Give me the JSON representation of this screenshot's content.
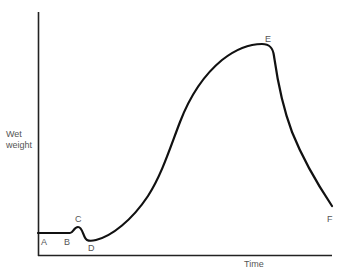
{
  "figure": {
    "y_axis_label_line1": "Wet",
    "y_axis_label_line2": "weight",
    "x_axis_label": "Time",
    "point_labels": {
      "A": "A",
      "B": "B",
      "C": "C",
      "D": "D",
      "E": "E",
      "F": "F"
    },
    "colors": {
      "curve": "#111111",
      "axes": "#222222",
      "text": "#555555"
    }
  }
}
